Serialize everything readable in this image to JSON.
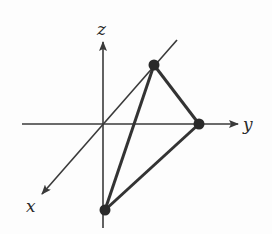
{
  "diagram": {
    "type": "3d-axes-triangle",
    "colors": {
      "axis": "#3a3a3a",
      "edge": "#333333",
      "point": "#2a2a2a",
      "label": "#2a2a2a",
      "background": "#fdfdfd"
    },
    "origin": {
      "x": 103,
      "y": 124
    },
    "axes": [
      {
        "name": "z",
        "label": "z",
        "from": [
          103,
          228
        ],
        "to": [
          103,
          42
        ],
        "label_pos": [
          97,
          35
        ]
      },
      {
        "name": "y",
        "label": "y",
        "from": [
          22,
          124
        ],
        "to": [
          238,
          124
        ],
        "label_pos": [
          243,
          130
        ]
      },
      {
        "name": "x",
        "label": "x",
        "from": [
          177,
          40
        ],
        "to": [
          42,
          194
        ],
        "label_pos": [
          26,
          212
        ]
      }
    ],
    "points": [
      {
        "id": "A",
        "on_axis": "x",
        "cx": 154,
        "cy": 65
      },
      {
        "id": "B",
        "on_axis": "y",
        "cx": 199,
        "cy": 124
      },
      {
        "id": "C",
        "on_axis": "z",
        "cx": 105,
        "cy": 210
      }
    ],
    "edges": [
      {
        "from": "A",
        "to": "B"
      },
      {
        "from": "A",
        "to": "C"
      },
      {
        "from": "B",
        "to": "C"
      }
    ]
  },
  "labels": {
    "x": "x",
    "y": "y",
    "z": "z"
  }
}
